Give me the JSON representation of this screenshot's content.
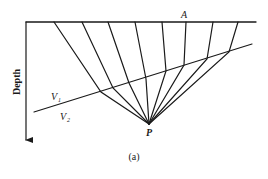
{
  "figure": {
    "caption": "(a)",
    "axis_label": "Depth",
    "surface_point_label": "A",
    "source_point_label": "P",
    "upper_layer_label": "V",
    "upper_layer_sub": "1",
    "lower_layer_label": "V",
    "lower_layer_sub": "2"
  },
  "geometry": {
    "surface": {
      "x1": 26,
      "y1": 22,
      "x2": 256,
      "y2": 22
    },
    "depth_axis": {
      "x": 26,
      "y1": 22,
      "y2": 140
    },
    "interface": {
      "x1": 34,
      "y1": 112,
      "x2": 252,
      "y2": 44
    },
    "source_point": {
      "x": 149,
      "y": 124
    },
    "rays": [
      {
        "surface_x": 54,
        "interface": [
          101,
          92
        ]
      },
      {
        "surface_x": 82,
        "interface": [
          113,
          88
        ]
      },
      {
        "surface_x": 108,
        "interface": [
          129,
          83
        ]
      },
      {
        "surface_x": 135,
        "interface": [
          146,
          79
        ]
      },
      {
        "surface_x": 162,
        "interface": [
          166,
          71
        ]
      },
      {
        "surface_x": 186,
        "interface": [
          184,
          65
        ]
      },
      {
        "surface_x": 213,
        "interface": [
          207,
          59
        ]
      },
      {
        "surface_x": 238,
        "interface": [
          229,
          52
        ]
      }
    ]
  },
  "colors": {
    "ink": "#1a1a1a",
    "background": "#ffffff"
  }
}
